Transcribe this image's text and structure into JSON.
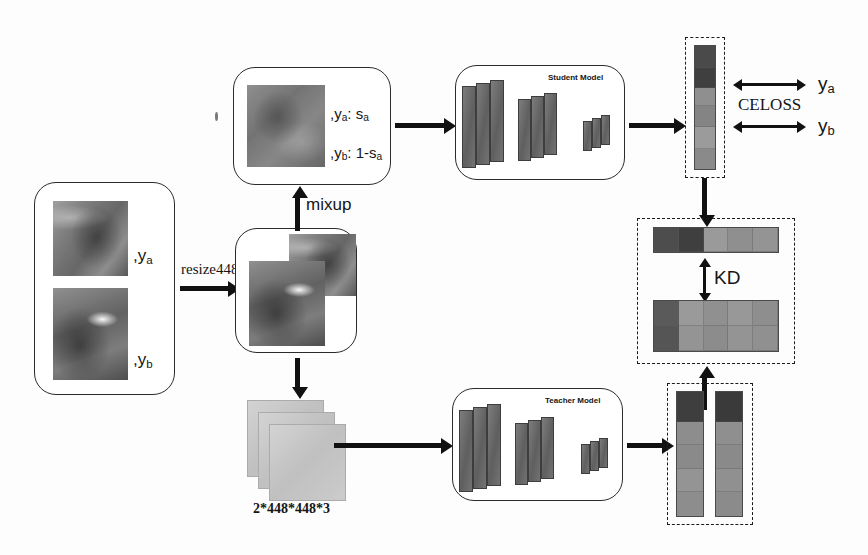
{
  "diagram": {
    "source_box": {
      "name": "source images",
      "label_a": ",y",
      "label_a_sub": "a",
      "label_b": ",y",
      "label_b_sub": "b"
    },
    "edges": {
      "resize": "resize448",
      "mixup": "mixup"
    },
    "mixup_box": {
      "label_a_text": ",y",
      "label_a_sub": "a",
      "label_a_value": ": s",
      "label_a_value_sub": "a",
      "label_b_text": ",y",
      "label_b_sub": "b",
      "label_b_value": ": 1-s",
      "label_b_value_sub": "a"
    },
    "patch_stack": {
      "caption": "2*448*448*3"
    },
    "student_model": {
      "label": "Student Model"
    },
    "teacher_model": {
      "label": "Teacher Model"
    },
    "losses": {
      "celoss": "CELOSS",
      "kd": "KD",
      "target_a": "y",
      "target_a_sub": "a",
      "target_b": "y",
      "target_b_sub": "b"
    },
    "colors": {
      "stroke": "#1c1c1c",
      "slab": "#6f6f6f",
      "bar_dark": "#4f4f4f",
      "bar_light": "#9e9e9e",
      "patch": "#c2c2c2"
    },
    "student_logits": [
      {
        "shade": "#4a4a4a",
        "h": 22
      },
      {
        "shade": "#3f3f3f",
        "h": 20
      },
      {
        "shade": "#8f8f8f",
        "h": 18
      },
      {
        "shade": "#848484",
        "h": 20
      },
      {
        "shade": "#9b9b9b",
        "h": 22
      },
      {
        "shade": "#8a8a8a",
        "h": 20
      }
    ],
    "teacher_logits_left": [
      {
        "shade": "#3e3e3e",
        "h": 24
      },
      {
        "shade": "#8d8d8d",
        "h": 19
      },
      {
        "shade": "#8a8a8a",
        "h": 19
      },
      {
        "shade": "#949494",
        "h": 19
      },
      {
        "shade": "#8d8d8d",
        "h": 19
      }
    ],
    "teacher_logits_right": [
      {
        "shade": "#3a3a3a",
        "h": 24
      },
      {
        "shade": "#8f8f8f",
        "h": 19
      },
      {
        "shade": "#8a8a8a",
        "h": 19
      },
      {
        "shade": "#909090",
        "h": 19
      },
      {
        "shade": "#8b8b8b",
        "h": 19
      }
    ],
    "kd_top_strip": [
      "#4d4d4d",
      "#3f3f3f",
      "#9a9a9a",
      "#8f8f8f",
      "#949494"
    ],
    "kd_bottom_grid": [
      [
        "#5a5a5a",
        "#9a9a9a",
        "#909090",
        "#989898",
        "#8e8e8e"
      ],
      [
        "#555555",
        "#949494",
        "#8c8c8c",
        "#949494",
        "#909090"
      ]
    ]
  }
}
